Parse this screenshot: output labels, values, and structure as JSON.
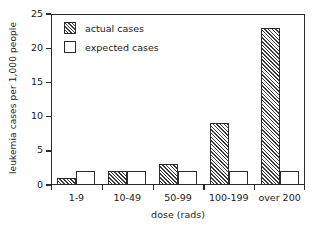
{
  "chart_data": {
    "type": "bar",
    "title": "",
    "subtitle": "",
    "xlabel": "dose (rads)",
    "ylabel": "leukemia cases per 1,000 people",
    "categories": [
      "1-9",
      "10-49",
      "50-99",
      "100-199",
      "over 200"
    ],
    "series": [
      {
        "name": "actual cases",
        "values": [
          1,
          2,
          3,
          9,
          23
        ],
        "fill": "hatched"
      },
      {
        "name": "expected cases",
        "values": [
          2,
          2,
          2,
          2,
          2
        ],
        "fill": "empty"
      }
    ],
    "ylim": [
      0,
      25
    ],
    "yticks": [
      0,
      5,
      10,
      15,
      20,
      25
    ],
    "ytick_labels": [
      "0",
      "5",
      "10",
      "15",
      "20",
      "25"
    ],
    "grid": false,
    "legend_position": "top-left",
    "colors": {
      "axis": "#2b2b2b",
      "hatch": "#3a3a3a",
      "background": "#ffffff",
      "text": "#1a1a1a"
    }
  }
}
